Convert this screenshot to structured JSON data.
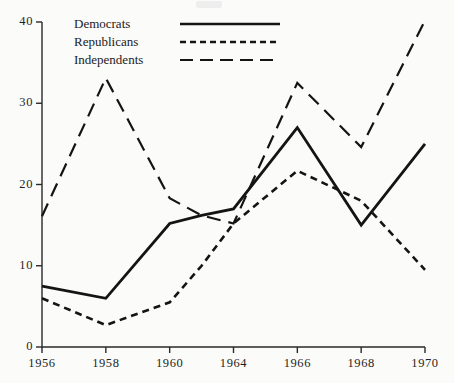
{
  "chart_data": {
    "type": "line",
    "title": "",
    "xlabel": "",
    "ylabel": "",
    "xlim": [
      1956,
      1970
    ],
    "ylim": [
      0,
      40
    ],
    "grid": false,
    "legend_position": "top-left",
    "x_tick_labels": [
      "1956",
      "1958",
      "1960",
      "1964",
      "1966",
      "1968",
      "1970"
    ],
    "y_tick_labels": [
      "0",
      "10",
      "20",
      "30",
      "40"
    ],
    "y_ticks": [
      0,
      10,
      20,
      30,
      40
    ],
    "x": [
      1956,
      1958,
      1960,
      1962,
      1964,
      1966,
      1968,
      1970
    ],
    "series": [
      {
        "name": "Democrats",
        "style": "solid",
        "color": "#141414",
        "values": [
          7.5,
          6.0,
          15.2,
          16.2,
          17.0,
          27.0,
          15.0,
          25.0
        ]
      },
      {
        "name": "Republicans",
        "style": "dotted",
        "color": "#141414",
        "values": [
          6.0,
          2.7,
          5.5,
          10.0,
          15.2,
          21.7,
          18.0,
          9.5
        ]
      },
      {
        "name": "Independents",
        "style": "dashed",
        "color": "#141414",
        "values": [
          16.1,
          33.1,
          18.3,
          16.2,
          15.2,
          32.5,
          24.6,
          40.2
        ]
      }
    ]
  },
  "legend": {
    "items": [
      {
        "label": "Democrats",
        "style": "solid"
      },
      {
        "label": "Republicans",
        "style": "dotted"
      },
      {
        "label": "Independents",
        "style": "dashed"
      }
    ]
  },
  "axes": {
    "axis_color": "#2a2a2a",
    "accent": "#141414"
  }
}
